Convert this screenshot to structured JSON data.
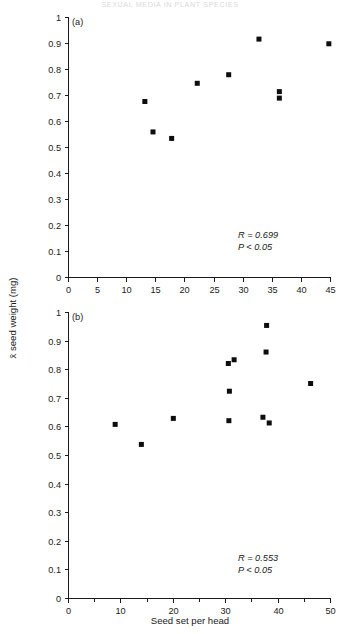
{
  "running_head": "SEXUAL MEDIA IN PLANT SPECIES",
  "figure": {
    "y_axis_title": "x̄ seed weight (mg)",
    "x_axis_title": "Seed set per head"
  },
  "chart_data": [
    {
      "type": "scatter",
      "panel_label": "(a)",
      "title": "",
      "xlabel": "",
      "ylabel": "x̄ seed weight (mg)",
      "xlim": [
        0,
        45
      ],
      "ylim": [
        0,
        1
      ],
      "xticks": [
        0,
        5,
        10,
        15,
        20,
        25,
        30,
        35,
        40,
        45
      ],
      "xtick_labels": [
        "0",
        "5",
        "10",
        "15",
        "20",
        "25",
        "30",
        "35",
        "40",
        "45"
      ],
      "yticks": [
        0,
        0.1,
        0.2,
        0.3,
        0.4,
        0.5,
        0.6,
        0.7,
        0.8,
        0.9,
        1
      ],
      "ytick_labels": [
        "0",
        "0.1",
        "0.2",
        "0.3",
        "0.4",
        "0.5",
        "0.6",
        "0.7",
        "0.8",
        "0.9",
        "1"
      ],
      "grid": false,
      "legend": "none",
      "marker": "filled-square",
      "points": [
        {
          "x": 13.2,
          "y": 0.675
        },
        {
          "x": 14.6,
          "y": 0.558
        },
        {
          "x": 17.8,
          "y": 0.533
        },
        {
          "x": 22.2,
          "y": 0.745
        },
        {
          "x": 27.6,
          "y": 0.778
        },
        {
          "x": 32.8,
          "y": 0.915
        },
        {
          "x": 36.3,
          "y": 0.713
        },
        {
          "x": 36.3,
          "y": 0.688
        },
        {
          "x": 44.8,
          "y": 0.897
        }
      ],
      "annotations": [
        {
          "text": "R = 0.699",
          "symbol": "R",
          "operator": "=",
          "value": "0.699"
        },
        {
          "text": "P < 0.05",
          "symbol": "P",
          "operator": "<",
          "value": "0.05"
        }
      ]
    },
    {
      "type": "scatter",
      "panel_label": "(b)",
      "title": "",
      "xlabel": "Seed set per head",
      "ylabel": "x̄ seed weight (mg)",
      "xlim": [
        0,
        50
      ],
      "ylim": [
        0,
        1
      ],
      "xticks": [
        0,
        10,
        20,
        30,
        40,
        50
      ],
      "xtick_labels": [
        "0",
        "10",
        "20",
        "30",
        "40",
        "50"
      ],
      "xminorticks": [
        5,
        15,
        25,
        35,
        45
      ],
      "yticks": [
        0,
        0.1,
        0.2,
        0.3,
        0.4,
        0.5,
        0.6,
        0.7,
        0.8,
        0.9,
        1
      ],
      "ytick_labels": [
        "0",
        "0.1",
        "0.2",
        "0.3",
        "0.4",
        "0.5",
        "0.6",
        "0.7",
        "0.8",
        "0.9",
        "1"
      ],
      "grid": false,
      "legend": "none",
      "marker": "filled-square",
      "points": [
        {
          "x": 9.0,
          "y": 0.607
        },
        {
          "x": 14.0,
          "y": 0.537
        },
        {
          "x": 20.1,
          "y": 0.628
        },
        {
          "x": 30.6,
          "y": 0.82
        },
        {
          "x": 31.7,
          "y": 0.833
        },
        {
          "x": 30.8,
          "y": 0.723
        },
        {
          "x": 30.7,
          "y": 0.62
        },
        {
          "x": 37.9,
          "y": 0.953
        },
        {
          "x": 37.8,
          "y": 0.86
        },
        {
          "x": 37.2,
          "y": 0.632
        },
        {
          "x": 38.4,
          "y": 0.612
        },
        {
          "x": 46.3,
          "y": 0.75
        }
      ],
      "annotations": [
        {
          "text": "R = 0.553",
          "symbol": "R",
          "operator": "=",
          "value": "0.553"
        },
        {
          "text": "P < 0.05",
          "symbol": "P",
          "operator": "<",
          "value": "0.05"
        }
      ]
    }
  ]
}
